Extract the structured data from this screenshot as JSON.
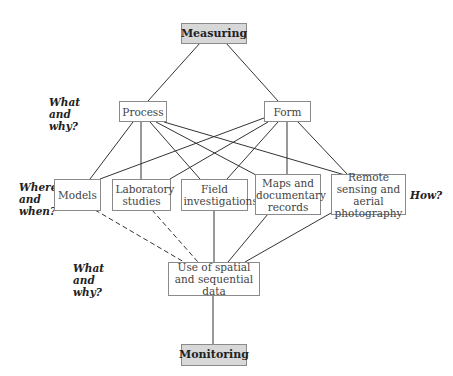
{
  "diagram": {
    "nodes": {
      "measuring": "Measuring",
      "process": "Process",
      "form": "Form",
      "models": "Models",
      "laboratory": "Laboratory studies",
      "field": "Field investigations",
      "maps": "Maps and documentary records",
      "remote": "Remote sensing and aerial photography",
      "use": "Use of spatial and sequential data",
      "monitoring": "Monitoring"
    },
    "questions": {
      "what_why_top": "What and why?",
      "where_when": "Where and when?",
      "how": "How?",
      "what_why_bottom": "What and why?"
    },
    "edges": [
      {
        "from": "measuring",
        "to": "process",
        "style": "solid"
      },
      {
        "from": "measuring",
        "to": "form",
        "style": "solid"
      },
      {
        "from": "process",
        "to": "models",
        "style": "solid"
      },
      {
        "from": "process",
        "to": "laboratory",
        "style": "solid"
      },
      {
        "from": "process",
        "to": "field",
        "style": "solid"
      },
      {
        "from": "process",
        "to": "maps",
        "style": "solid"
      },
      {
        "from": "process",
        "to": "remote",
        "style": "solid"
      },
      {
        "from": "form",
        "to": "models",
        "style": "solid"
      },
      {
        "from": "form",
        "to": "laboratory",
        "style": "solid"
      },
      {
        "from": "form",
        "to": "field",
        "style": "solid"
      },
      {
        "from": "form",
        "to": "maps",
        "style": "solid"
      },
      {
        "from": "form",
        "to": "remote",
        "style": "solid"
      },
      {
        "from": "models",
        "to": "use",
        "style": "dashed"
      },
      {
        "from": "laboratory",
        "to": "use",
        "style": "dashed"
      },
      {
        "from": "field",
        "to": "use",
        "style": "solid"
      },
      {
        "from": "maps",
        "to": "use",
        "style": "solid"
      },
      {
        "from": "remote",
        "to": "use",
        "style": "solid"
      },
      {
        "from": "use",
        "to": "monitoring",
        "style": "solid"
      }
    ],
    "colors": {
      "key_fill": "#d8d8d8",
      "border": "#8a8a8a",
      "line": "#333333"
    }
  }
}
